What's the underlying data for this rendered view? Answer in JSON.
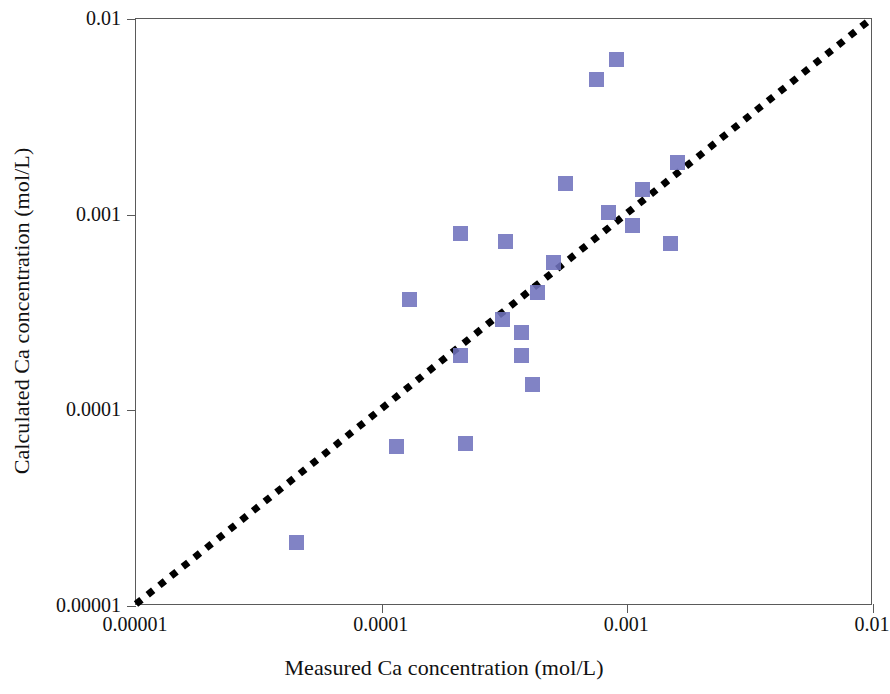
{
  "chart_data": {
    "type": "scatter",
    "title": "",
    "xlabel": "Measured Ca concentration (mol/L)",
    "ylabel": "Calculated Ca concentration (mol/L)",
    "xscale": "log",
    "yscale": "log",
    "xlim": [
      1e-05,
      0.01
    ],
    "ylim": [
      1e-05,
      0.01
    ],
    "grid": false,
    "legend": null,
    "xticks": [
      "0.00001",
      "0.0001",
      "0.001",
      "0.01"
    ],
    "xtick_values": [
      1e-05,
      0.0001,
      0.001,
      0.01
    ],
    "yticks": [
      "0.00001",
      "0.0001",
      "0.001",
      "0.01"
    ],
    "ytick_values": [
      1e-05,
      0.0001,
      0.001,
      0.01
    ],
    "marker_color": "#6f72bd",
    "marker_shape": "square",
    "series": [
      {
        "name": "samples",
        "points": [
          {
            "x": 4.5e-05,
            "y": 2.1e-05
          },
          {
            "x": 0.000115,
            "y": 6.5e-05
          },
          {
            "x": 0.00013,
            "y": 0.00037
          },
          {
            "x": 0.00021,
            "y": 0.00019
          },
          {
            "x": 0.00021,
            "y": 0.0008
          },
          {
            "x": 0.00022,
            "y": 6.8e-05
          },
          {
            "x": 0.00031,
            "y": 0.00029
          },
          {
            "x": 0.00032,
            "y": 0.00073
          },
          {
            "x": 0.00037,
            "y": 0.00025
          },
          {
            "x": 0.00037,
            "y": 0.00019
          },
          {
            "x": 0.00041,
            "y": 0.000135
          },
          {
            "x": 0.00043,
            "y": 0.0004
          },
          {
            "x": 0.0005,
            "y": 0.00057
          },
          {
            "x": 0.00056,
            "y": 0.00145
          },
          {
            "x": 0.00075,
            "y": 0.0049
          },
          {
            "x": 0.00084,
            "y": 0.00103
          },
          {
            "x": 0.0009,
            "y": 0.0062
          },
          {
            "x": 0.00105,
            "y": 0.00088
          },
          {
            "x": 0.00115,
            "y": 0.00135
          },
          {
            "x": 0.0015,
            "y": 0.00071
          },
          {
            "x": 0.0016,
            "y": 0.00185
          }
        ]
      }
    ],
    "reference_line": {
      "name": "1:1 line",
      "style": "dotted",
      "color": "#000000",
      "from": [
        1e-05,
        1e-05
      ],
      "to": [
        0.01,
        0.01
      ]
    }
  },
  "axes": {
    "x_title": "Measured Ca concentration (mol/L)",
    "y_title": "Calculated Ca concentration (mol/L)"
  }
}
